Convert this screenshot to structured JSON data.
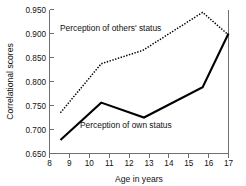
{
  "chart_data": {
    "type": "line",
    "title": "",
    "xlabel": "Age in years",
    "ylabel": "Correlational scores",
    "xlim": [
      8,
      17
    ],
    "ylim": [
      0.65,
      0.95
    ],
    "xticks": [
      8,
      9,
      10,
      11,
      12,
      13,
      14,
      15,
      16,
      17
    ],
    "xtick_labels": [
      "8",
      "9",
      "10",
      "11",
      "12",
      "13",
      "14",
      "15",
      "16",
      "17"
    ],
    "yticks": [
      0.65,
      0.7,
      0.75,
      0.8,
      0.85,
      0.9,
      0.95
    ],
    "ytick_labels": [
      "0.650",
      "0.700",
      "0.750",
      "0.800",
      "0.850",
      "0.900",
      "0.950"
    ],
    "grid": false,
    "legend": "inline-annotations",
    "series": [
      {
        "name": "Perception of others' status",
        "style": "dotted",
        "color": "#000000",
        "x": [
          8.55,
          10.6,
          12.7,
          15.7,
          17.0
        ],
        "values": [
          0.735,
          0.837,
          0.865,
          0.944,
          0.897
        ]
      },
      {
        "name": "Perception of own status",
        "style": "solid",
        "color": "#000000",
        "x": [
          8.55,
          10.6,
          12.75,
          15.7,
          17.0
        ],
        "values": [
          0.678,
          0.756,
          0.725,
          0.788,
          0.9
        ]
      }
    ],
    "annotations": [
      {
        "text": "Perception of others' status",
        "x": 9.35,
        "y": 0.915
      },
      {
        "text": "Perception of own status",
        "x": 10.35,
        "y": 0.69
      }
    ]
  },
  "axes": {
    "x_title": "Age in years",
    "y_title": "Correlational scores"
  },
  "labels": {
    "others": "Perception of others' status",
    "own": "Perception of own status"
  }
}
